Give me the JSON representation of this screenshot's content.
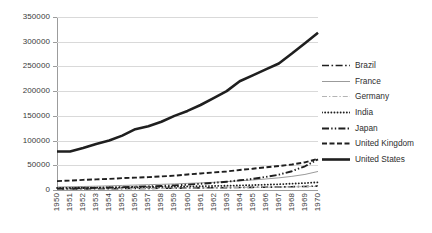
{
  "chart_data": {
    "type": "line",
    "title": "",
    "xlabel": "",
    "ylabel": "",
    "ylim": [
      0,
      350000
    ],
    "yticks": [
      0,
      50000,
      100000,
      150000,
      200000,
      250000,
      300000,
      350000
    ],
    "ytick_labels": [
      "0",
      "50000",
      "100000",
      "150000",
      "200000",
      "250000",
      "300000",
      "350000"
    ],
    "grid": true,
    "legend_position": "right",
    "x": [
      1950,
      1951,
      1952,
      1953,
      1954,
      1955,
      1956,
      1957,
      1958,
      1959,
      1960,
      1961,
      1962,
      1963,
      1964,
      1965,
      1966,
      1967,
      1968,
      1969,
      1970
    ],
    "xtick_labels": [
      "1950",
      "1951",
      "1952",
      "1953",
      "1954",
      "1955",
      "1956",
      "1957",
      "1958",
      "1959",
      "1960",
      "1961",
      "1962",
      "1963",
      "1964",
      "1965",
      "1966",
      "1967",
      "1968",
      "1969",
      "1970"
    ],
    "series": [
      {
        "name": "Brazil",
        "style": "dash-dot",
        "color": "#1f1f1f",
        "width": 1.6,
        "values": [
          2000,
          2100,
          2300,
          2400,
          2600,
          2900,
          3000,
          3200,
          3500,
          3700,
          4000,
          4300,
          4600,
          4800,
          5100,
          5400,
          5700,
          6100,
          6600,
          7200,
          7900
        ]
      },
      {
        "name": "France",
        "style": "solid-thin",
        "color": "#9b9b9b",
        "width": 1.0,
        "values": [
          6000,
          6600,
          7100,
          7700,
          8400,
          9200,
          10000,
          10800,
          11500,
          12300,
          13400,
          14400,
          15600,
          17000,
          18600,
          20300,
          22300,
          24600,
          27600,
          31500,
          37500
        ]
      },
      {
        "name": "Germany",
        "style": "dash-dot-thin",
        "color": "#b4b4b4",
        "width": 1.0,
        "values": [
          1500,
          1700,
          1900,
          2100,
          2300,
          2600,
          2800,
          3000,
          3200,
          3500,
          3800,
          4100,
          4400,
          4700,
          5000,
          5300,
          5600,
          6000,
          6400,
          6900,
          7400
        ]
      },
      {
        "name": "India",
        "style": "dotted",
        "color": "#1f1f1f",
        "width": 1.8,
        "values": [
          4200,
          4400,
          4600,
          4800,
          5100,
          5400,
          5700,
          6000,
          6400,
          6800,
          7200,
          7700,
          8200,
          8700,
          9300,
          10000,
          10800,
          11700,
          12800,
          14000,
          15600
        ]
      },
      {
        "name": "Japan",
        "style": "dash-dot-dot",
        "color": "#1f1f1f",
        "width": 1.9,
        "values": [
          3000,
          3400,
          3900,
          4400,
          5000,
          5700,
          6500,
          7400,
          8200,
          9300,
          10800,
          12600,
          14500,
          16800,
          19600,
          22500,
          26500,
          31000,
          38000,
          48000,
          62000
        ]
      },
      {
        "name": "United Kingdom",
        "style": "dashed",
        "color": "#1f1f1f",
        "width": 1.9,
        "values": [
          18000,
          19000,
          20500,
          21500,
          22500,
          24000,
          25000,
          26000,
          27500,
          29000,
          31500,
          33500,
          35500,
          37500,
          40500,
          43000,
          46000,
          48500,
          51500,
          56000,
          63000
        ]
      },
      {
        "name": "United States",
        "style": "solid-thick",
        "color": "#1f1f1f",
        "width": 2.6,
        "values": [
          78000,
          78000,
          85000,
          93000,
          100000,
          110000,
          123000,
          129000,
          138000,
          150000,
          160000,
          172000,
          186000,
          200000,
          220000,
          232000,
          244000,
          256000,
          276000,
          297000,
          318000
        ]
      }
    ]
  }
}
